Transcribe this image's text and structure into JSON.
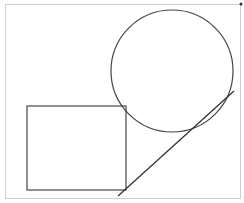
{
  "diagram": {
    "width": 244,
    "height": 203,
    "frame": {
      "x": 5,
      "y": 4,
      "width": 235,
      "height": 194,
      "stroke": "#cfcfcf"
    },
    "circle": {
      "cx": 172,
      "cy": 71,
      "r": 61,
      "stroke": "#444444"
    },
    "rectangle": {
      "x": 27,
      "y": 106,
      "width": 99,
      "height": 84,
      "stroke": "#555555"
    },
    "line": {
      "x1": 118,
      "y1": 196,
      "x2": 234,
      "y2": 91,
      "stroke": "#333333"
    },
    "corner_marker": {
      "x": 241,
      "y": 4,
      "color": "#333333"
    },
    "colors": {
      "background": "#ffffff"
    }
  }
}
